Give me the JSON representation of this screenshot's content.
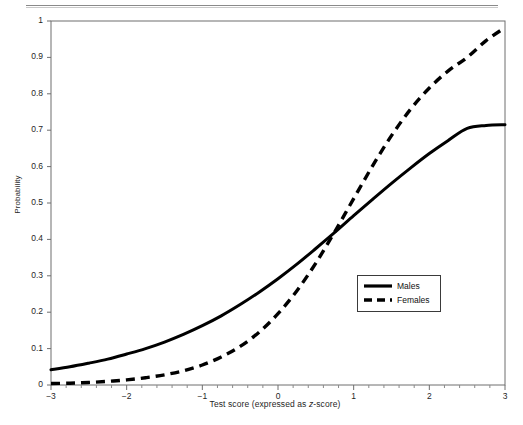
{
  "figure": {
    "header_rule": "page-divider-rule",
    "background_color": "#ffffff",
    "line_color": "#000000"
  },
  "axes": {
    "y_label": "Probability",
    "x_label_prefix": "Test score (expressed as ",
    "x_label_italic": "z",
    "x_label_suffix": "-score)",
    "x_label_full": "Test score (expressed as z-score)",
    "y_ticks": [
      "0",
      "0.1",
      "0.2",
      "0.3",
      "0.4",
      "0.5",
      "0.6",
      "0.7",
      "0.8",
      "0.9",
      "1"
    ],
    "x_ticks": [
      "-3",
      "-2",
      "-1",
      "0",
      "1",
      "2",
      "3"
    ]
  },
  "legend": {
    "position": "inside-right-center",
    "entries": [
      {
        "label": "Males",
        "style": "solid",
        "color": "#000000"
      },
      {
        "label": "Females",
        "style": "dashed",
        "color": "#000000"
      }
    ]
  },
  "chart_data": {
    "type": "line",
    "title": "",
    "xlabel": "Test score (expressed as z-score)",
    "ylabel": "Probability",
    "xlim": [
      -3,
      3
    ],
    "ylim": [
      0,
      1
    ],
    "grid": false,
    "legend_position": "center-right inside plot",
    "x": [
      -3,
      -2.75,
      -2.5,
      -2.25,
      -2,
      -1.75,
      -1.5,
      -1.25,
      -1,
      -0.75,
      -0.5,
      -0.25,
      0,
      0.25,
      0.5,
      0.75,
      1,
      1.25,
      1.5,
      1.75,
      2,
      2.25,
      2.5,
      2.75,
      3
    ],
    "series": [
      {
        "name": "Males",
        "style": "solid",
        "color": "#000000",
        "values": [
          0.042,
          0.05,
          0.06,
          0.071,
          0.085,
          0.1,
          0.118,
          0.139,
          0.163,
          0.19,
          0.221,
          0.255,
          0.292,
          0.332,
          0.375,
          0.419,
          0.465,
          0.51,
          0.554,
          0.596,
          0.636,
          0.672,
          0.705,
          0.713,
          0.715
        ]
      },
      {
        "name": "Females",
        "style": "dashed",
        "color": "#000000",
        "values": [
          0.004,
          0.005,
          0.007,
          0.01,
          0.014,
          0.02,
          0.028,
          0.039,
          0.055,
          0.077,
          0.106,
          0.145,
          0.196,
          0.259,
          0.335,
          0.421,
          0.512,
          0.602,
          0.685,
          0.757,
          0.816,
          0.863,
          0.9,
          0.946,
          0.982
        ]
      }
    ],
    "annotations": [
      {
        "text": "curves cross near z = 0, probability ~0.25"
      }
    ]
  }
}
